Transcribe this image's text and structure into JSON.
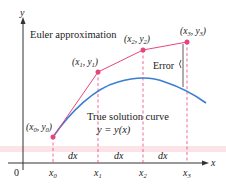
{
  "diagram": {
    "axes": {
      "x_label": "x",
      "y_label": "y",
      "origin_label": "0",
      "x_ticks": [
        "x0",
        "x1",
        "x2",
        "x3"
      ]
    },
    "labels": {
      "euler": "Euler approximation",
      "true_curve_line1": "True solution curve",
      "true_curve_line2": "y = y(x)",
      "error": "Error",
      "dx": "dx"
    },
    "points": [
      {
        "name": "(x0, y0)",
        "x_sub": "0",
        "y_sub": "0"
      },
      {
        "name": "(x1, y1)",
        "x_sub": "1",
        "y_sub": "1"
      },
      {
        "name": "(x2, y2)",
        "x_sub": "2",
        "y_sub": "2"
      },
      {
        "name": "(x3, y3)",
        "x_sub": "3",
        "y_sub": "3"
      }
    ],
    "colors": {
      "euler": "#e8457e",
      "curve": "#3b7dd0",
      "axis": "#333333",
      "dashed": "#e8457e",
      "band": "#f7c9d2"
    }
  }
}
